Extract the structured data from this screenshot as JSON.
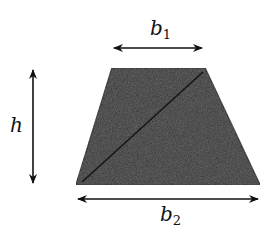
{
  "diagram": {
    "shape": "trapezoid",
    "fill_color": "#2e2e2e",
    "diagonal_color": "#1a1a1a",
    "labels": {
      "b1": {
        "main": "b",
        "sub": "1"
      },
      "b2": {
        "main": "b",
        "sub": "2"
      },
      "h": {
        "main": "h"
      }
    }
  }
}
